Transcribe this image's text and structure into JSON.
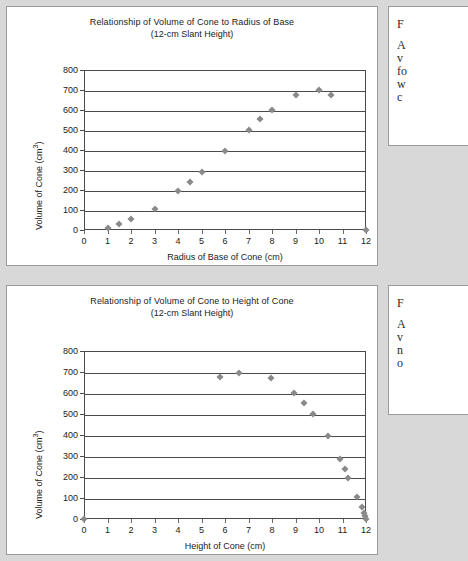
{
  "notes": {
    "note1": {
      "head": "F",
      "lines": [
        "A",
        "v",
        "fo",
        "w",
        "c"
      ]
    },
    "note2": {
      "head": "F",
      "lines": [
        "A",
        "v",
        "n",
        "o"
      ]
    }
  },
  "chart_data": [
    {
      "id": "chart-radius",
      "type": "scatter",
      "title": "Relationship of Volume of Cone to Radius of Base",
      "subtitle": "(12-cm Slant Height)",
      "xlabel": "Radius of Base of Cone (cm)",
      "ylabel": "Volume of Cone (cm³)",
      "ylabel_base": "Volume of Cone  (cm",
      "ylabel_sup": "3",
      "ylabel_tail": ")",
      "xlim": [
        0,
        12
      ],
      "ylim": [
        0,
        800
      ],
      "xticks": [
        0,
        1,
        2,
        3,
        4,
        5,
        6,
        7,
        8,
        9,
        10,
        11,
        12
      ],
      "yticks": [
        0,
        100,
        200,
        300,
        400,
        500,
        600,
        700,
        800
      ],
      "grid": true,
      "legend": "none",
      "marker": "diamond",
      "marker_color": "#8a8a8a",
      "points": [
        {
          "x": 1,
          "y": 12
        },
        {
          "x": 1.5,
          "y": 28
        },
        {
          "x": 2,
          "y": 55
        },
        {
          "x": 3,
          "y": 107
        },
        {
          "x": 4,
          "y": 193
        },
        {
          "x": 4.5,
          "y": 240
        },
        {
          "x": 5,
          "y": 288
        },
        {
          "x": 6,
          "y": 396
        },
        {
          "x": 7,
          "y": 500
        },
        {
          "x": 7.5,
          "y": 553
        },
        {
          "x": 8,
          "y": 600
        },
        {
          "x": 9,
          "y": 675
        },
        {
          "x": 10,
          "y": 702
        },
        {
          "x": 10.5,
          "y": 675
        },
        {
          "x": 12,
          "y": 0
        }
      ]
    },
    {
      "id": "chart-height",
      "type": "scatter",
      "title": "Relationship of Volume of Cone to Height of Cone",
      "subtitle": "(12-cm Slant Height)",
      "xlabel": "Height of Cone (cm)",
      "ylabel": "Volume of Cone (cm³)",
      "ylabel_base": "Volume of Cone  (cm",
      "ylabel_sup": "3",
      "ylabel_tail": ")",
      "xlim": [
        0,
        12
      ],
      "ylim": [
        0,
        800
      ],
      "xticks": [
        0,
        1,
        2,
        3,
        4,
        5,
        6,
        7,
        8,
        9,
        10,
        11,
        12
      ],
      "yticks": [
        0,
        100,
        200,
        300,
        400,
        500,
        600,
        700,
        800
      ],
      "grid": true,
      "legend": "none",
      "marker": "diamond",
      "marker_color": "#8a8a8a",
      "points": [
        {
          "x": 0,
          "y": 0
        },
        {
          "x": 5.8,
          "y": 675
        },
        {
          "x": 6.6,
          "y": 695
        },
        {
          "x": 7.95,
          "y": 672
        },
        {
          "x": 8.95,
          "y": 602
        },
        {
          "x": 9.35,
          "y": 552
        },
        {
          "x": 9.75,
          "y": 500
        },
        {
          "x": 10.4,
          "y": 396
        },
        {
          "x": 10.9,
          "y": 288
        },
        {
          "x": 11.1,
          "y": 240
        },
        {
          "x": 11.25,
          "y": 193
        },
        {
          "x": 11.6,
          "y": 107
        },
        {
          "x": 11.85,
          "y": 55
        },
        {
          "x": 11.9,
          "y": 28
        },
        {
          "x": 11.95,
          "y": 12
        },
        {
          "x": 12,
          "y": 0
        }
      ]
    }
  ]
}
